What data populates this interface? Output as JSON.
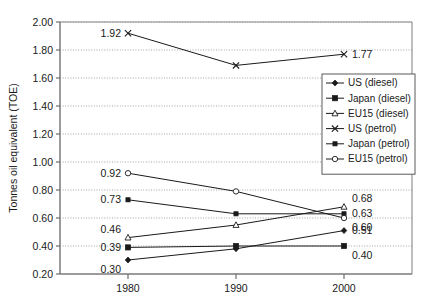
{
  "chart_data": {
    "type": "line",
    "title": "",
    "subtitle": "",
    "xlabel": "",
    "ylabel": "Tonnes oil equivalent (TOE)",
    "x": [
      1980,
      1990,
      2000
    ],
    "categories": [
      "1980",
      "1990",
      "2000"
    ],
    "xtick_labels": [
      "1980",
      "1990",
      "2000"
    ],
    "ytick_labels": [
      "0.20",
      "0.40",
      "0.60",
      "0.80",
      "1.00",
      "1.20",
      "1.40",
      "1.60",
      "1.80",
      "2.00"
    ],
    "ylim": [
      0.2,
      2.0
    ],
    "ytick_step": 0.2,
    "grid": "horizontal-dotted",
    "legend_position": "center-right-upper",
    "series": [
      {
        "name": "US (diesel)",
        "marker": "filled-diamond",
        "values": [
          0.3,
          0.38,
          0.51
        ],
        "labels": [
          {
            "text": "0.30",
            "value": 0.3,
            "at": 1980,
            "align": "left-below"
          },
          {
            "text": "0.51",
            "value": 0.51,
            "at": 2000,
            "align": "right"
          }
        ]
      },
      {
        "name": "Japan (diesel)",
        "marker": "filled-square",
        "values": [
          0.39,
          0.4,
          0.4
        ],
        "labels": [
          {
            "text": "0.39",
            "value": 0.39,
            "at": 1980,
            "align": "left"
          },
          {
            "text": "0.40",
            "value": 0.4,
            "at": 2000,
            "align": "right-below"
          }
        ]
      },
      {
        "name": "EU15 (diesel)",
        "marker": "open-triangle",
        "values": [
          0.46,
          0.55,
          0.68
        ],
        "labels": [
          {
            "text": "0.46",
            "value": 0.46,
            "at": 1980,
            "align": "left-above"
          },
          {
            "text": "0.68",
            "value": 0.68,
            "at": 2000,
            "align": "right-above"
          }
        ]
      },
      {
        "name": "US (petrol)",
        "marker": "cross",
        "values": [
          1.92,
          1.69,
          1.77
        ],
        "labels": [
          {
            "text": "1.92",
            "value": 1.92,
            "at": 1980,
            "align": "left"
          },
          {
            "text": "1.77",
            "value": 1.77,
            "at": 2000,
            "align": "right"
          }
        ]
      },
      {
        "name": "Japan (petrol)",
        "marker": "small-filled-square",
        "values": [
          0.73,
          0.63,
          0.63
        ],
        "labels": [
          {
            "text": "0.73",
            "value": 0.73,
            "at": 1980,
            "align": "left"
          },
          {
            "text": "0.63",
            "value": 0.63,
            "at": 2000,
            "align": "right"
          }
        ]
      },
      {
        "name": "EU15 (petrol)",
        "marker": "open-circle",
        "values": [
          0.92,
          0.79,
          0.6
        ],
        "labels": [
          {
            "text": "0.92",
            "value": 0.92,
            "at": 1980,
            "align": "left"
          },
          {
            "text": "0.60",
            "value": 0.6,
            "at": 2000,
            "align": "right-below"
          }
        ]
      }
    ],
    "colors": {
      "line": "#1a1a1a",
      "grid": "#8d8d8d",
      "axis": "#7a7a7a",
      "text": "#1a1a1a",
      "background": "#ffffff"
    }
  }
}
